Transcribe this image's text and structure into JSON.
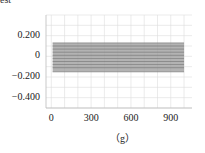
{
  "header": {
    "partial_text": "est"
  },
  "caption": "（g）",
  "chart_data": {
    "type": "line",
    "title": "",
    "xlabel": "",
    "ylabel": "",
    "xlim": [
      -40,
      1060
    ],
    "ylim": [
      -0.5,
      0.4
    ],
    "x_ticks": [
      0,
      300,
      600,
      900
    ],
    "x_tick_labels": [
      "0",
      "300",
      "600",
      "900"
    ],
    "y_ticks": [
      0.2,
      0,
      -0.2,
      -0.4
    ],
    "y_tick_labels": [
      "0.200",
      "0",
      "−0.200",
      "−0.400"
    ],
    "grid": true,
    "legend": null,
    "x": [
      10,
      1000
    ],
    "series_description": "Dense band of approximately flat gray lines spanning x=10..1000",
    "band": {
      "upper": 0.13,
      "lower": -0.15
    },
    "series": [
      {
        "name": "s1",
        "values": [
          0.13,
          0.13
        ]
      },
      {
        "name": "s2",
        "values": [
          0.1,
          0.1
        ]
      },
      {
        "name": "s3",
        "values": [
          0.07,
          0.07
        ]
      },
      {
        "name": "s4",
        "values": [
          0.04,
          0.04
        ]
      },
      {
        "name": "s5",
        "values": [
          0.01,
          0.01
        ]
      },
      {
        "name": "s6",
        "values": [
          -0.02,
          -0.02
        ]
      },
      {
        "name": "s7",
        "values": [
          -0.05,
          -0.05
        ]
      },
      {
        "name": "s8",
        "values": [
          -0.08,
          -0.08
        ]
      },
      {
        "name": "s9",
        "values": [
          -0.11,
          -0.11
        ]
      },
      {
        "name": "s10",
        "values": [
          -0.15,
          -0.15
        ]
      }
    ],
    "colors": {
      "band": "#9a9a9a",
      "line": "#6e6e6e",
      "grid": "#dddddd",
      "axis": "#bbbbbb"
    }
  }
}
